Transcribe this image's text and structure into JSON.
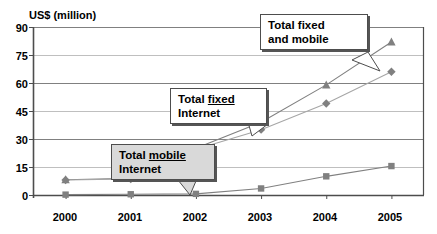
{
  "chart_data": {
    "type": "line",
    "title": "",
    "subtitle": "",
    "xlabel": "",
    "ylabel": "US$ (million)",
    "categories": [
      "2000",
      "2001",
      "2002",
      "2003",
      "2004",
      "2005"
    ],
    "x": [
      2000,
      2001,
      2002,
      2003,
      2004,
      2005
    ],
    "ylim": [
      0,
      90
    ],
    "yticks": [
      0,
      15,
      30,
      45,
      60,
      75,
      90
    ],
    "ytick_labels": [
      "0",
      "15",
      "30",
      "45",
      "60",
      "75",
      "90"
    ],
    "grid": true,
    "grid_axis": "y",
    "legend_position": "none",
    "legend_style": "callout-annotations",
    "series": [
      {
        "name": "Total fixed and mobile",
        "marker": "triangle",
        "color": "#808080",
        "line_color": "#808080",
        "values": [
          8.2,
          9.0,
          25.0,
          39.0,
          59.0,
          82.0
        ]
      },
      {
        "name": "Total fixed Internet",
        "marker": "diamond",
        "color": "#808080",
        "line_color": "#a6a6a6",
        "values": [
          8.0,
          8.6,
          24.5,
          35.0,
          49.0,
          66.0
        ]
      },
      {
        "name": "Total mobile Internet",
        "marker": "square",
        "color": "#808080",
        "line_color": "#808080",
        "values": [
          0.2,
          0.4,
          0.6,
          3.5,
          10.0,
          15.5
        ]
      }
    ],
    "annotations": [
      {
        "id": "total-fixed-and-mobile",
        "line1": "Total fixed",
        "line2": "and mobile",
        "underline_word": "",
        "fill": "#ffffff",
        "points_to_series": "Total fixed and mobile"
      },
      {
        "id": "total-fixed-internet",
        "line1_prefix": "Total ",
        "line1_underlined": "fixed",
        "line2": "Internet",
        "fill": "#ffffff",
        "points_to_series": "Total fixed Internet"
      },
      {
        "id": "total-mobile-internet",
        "line1_prefix": "Total ",
        "line1_underlined": "mobile",
        "line2": "Internet",
        "fill": "#d9d9d9",
        "points_to_series": "Total mobile Internet"
      }
    ]
  },
  "colors": {
    "axis": "#4d4d4d",
    "gridline": "#808080",
    "gridline_light": "#bfbfbf",
    "marker": "#808080",
    "callout_border": "#4d4d4d",
    "callout_shadow": "#555555",
    "callout_fill_white": "#ffffff",
    "callout_fill_gray": "#d9d9d9",
    "text": "#000000",
    "background": "#ffffff"
  }
}
